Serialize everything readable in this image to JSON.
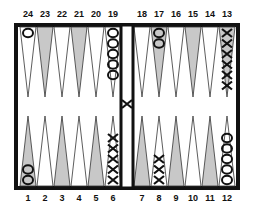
{
  "board": {
    "top_labels": [
      "24",
      "23",
      "22",
      "21",
      "20",
      "19",
      "18",
      "17",
      "16",
      "15",
      "14",
      "13"
    ],
    "bottom_labels": [
      "1",
      "2",
      "3",
      "4",
      "5",
      "6",
      "7",
      "8",
      "9",
      "10",
      "11",
      "12"
    ],
    "colors": {
      "border": "#111111",
      "shaded_point": "#c8c8c8",
      "light_point": "#ffffff",
      "checker_stroke": "#111111"
    },
    "shaded_points": [
      23,
      21,
      17,
      15,
      13,
      1,
      3,
      5,
      7,
      9,
      11
    ],
    "checkers": [
      {
        "point": 24,
        "player": "O",
        "count": 1
      },
      {
        "point": 19,
        "player": "O",
        "count": 5
      },
      {
        "point": 17,
        "player": "O",
        "count": 2
      },
      {
        "point": 13,
        "player": "X",
        "count": 6
      },
      {
        "point": 12,
        "player": "O",
        "count": 5
      },
      {
        "point": 8,
        "player": "X",
        "count": 3
      },
      {
        "point": 6,
        "player": "X",
        "count": 5
      },
      {
        "point": 1,
        "player": "O",
        "count": 2
      }
    ],
    "bar": [
      {
        "player": "X",
        "count": 1
      }
    ]
  }
}
